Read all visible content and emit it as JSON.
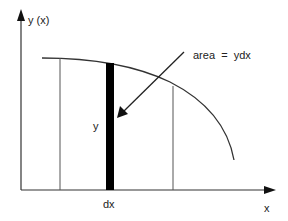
{
  "diagram": {
    "labels": {
      "y_axis": "y (x)",
      "x_axis": "x",
      "strip_height": "y",
      "strip_width": "dx",
      "annotation": "area  =  ydx"
    },
    "colors": {
      "line": "#333333",
      "strip": "#000000",
      "background": "#ffffff"
    },
    "elements": {
      "curve": "decreasing curve from upper left to lower right",
      "left_bound_line": "vertical line at lower integration limit",
      "right_bound_line": "vertical line at upper integration limit",
      "strip": "thin black vertical strip of height y and width dx",
      "arrow": "pointer from annotation to strip"
    }
  }
}
